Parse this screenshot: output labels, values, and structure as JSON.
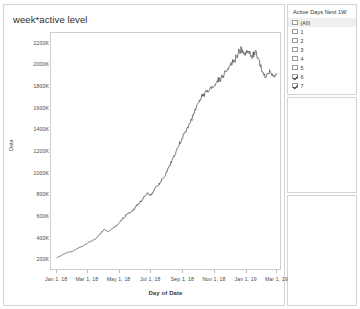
{
  "worksheet": {
    "title": "week*active level"
  },
  "chart_data": {
    "type": "line",
    "title": "week*active level",
    "xlabel": "Day of Date",
    "ylabel": "Data",
    "ylim": [
      100000,
      2300000
    ],
    "ytick_labels": [
      "2200K",
      "2000K",
      "1800K",
      "1600K",
      "1400K",
      "1200K",
      "1000K",
      "800K",
      "600K",
      "400K",
      "200K"
    ],
    "ytick_values": [
      2200000,
      2000000,
      1800000,
      1600000,
      1400000,
      1200000,
      1000000,
      800000,
      600000,
      400000,
      200000
    ],
    "xtick_labels": [
      "Jan 1, 18",
      "Mar 1, 18",
      "May 1, 18",
      "Jul 1, 18",
      "Sep 1, 18",
      "Nov 1, 18",
      "Jan 1, 19",
      "Mar 1, 19"
    ],
    "xlim": [
      "2017-12-20",
      "2019-03-10"
    ],
    "grid": false,
    "legend": "none",
    "line_color": "#5a5a5a",
    "series": [
      {
        "name": "week*active level",
        "x": [
          "2018-01-01",
          "2018-01-08",
          "2018-01-15",
          "2018-01-22",
          "2018-01-29",
          "2018-02-05",
          "2018-02-12",
          "2018-02-19",
          "2018-02-26",
          "2018-03-05",
          "2018-03-12",
          "2018-03-19",
          "2018-03-26",
          "2018-04-02",
          "2018-04-09",
          "2018-04-16",
          "2018-04-23",
          "2018-04-30",
          "2018-05-07",
          "2018-05-14",
          "2018-05-21",
          "2018-05-28",
          "2018-06-04",
          "2018-06-11",
          "2018-06-18",
          "2018-06-25",
          "2018-07-02",
          "2018-07-09",
          "2018-07-16",
          "2018-07-23",
          "2018-07-30",
          "2018-08-06",
          "2018-08-13",
          "2018-08-20",
          "2018-08-27",
          "2018-09-03",
          "2018-09-10",
          "2018-09-17",
          "2018-09-24",
          "2018-10-01",
          "2018-10-08",
          "2018-10-15",
          "2018-10-22",
          "2018-10-29",
          "2018-11-05",
          "2018-11-12",
          "2018-11-19",
          "2018-11-26",
          "2018-12-03",
          "2018-12-10",
          "2018-12-17",
          "2018-12-24",
          "2018-12-31",
          "2019-01-07",
          "2019-01-14",
          "2019-01-21",
          "2019-01-28",
          "2019-02-04",
          "2019-02-11",
          "2019-02-18",
          "2019-02-25",
          "2019-03-04"
        ],
        "values": [
          205000,
          225000,
          240000,
          258000,
          262000,
          280000,
          300000,
          312000,
          330000,
          352000,
          368000,
          392000,
          430000,
          470000,
          452000,
          470000,
          495000,
          520000,
          560000,
          600000,
          625000,
          640000,
          690000,
          720000,
          760000,
          800000,
          790000,
          840000,
          880000,
          930000,
          980000,
          1050000,
          1120000,
          1190000,
          1270000,
          1340000,
          1400000,
          1470000,
          1560000,
          1640000,
          1700000,
          1740000,
          1760000,
          1790000,
          1830000,
          1870000,
          1900000,
          1960000,
          2000000,
          2040000,
          2090000,
          2150000,
          2100000,
          2130000,
          2080000,
          2120000,
          2040000,
          1930000,
          1900000,
          1930000,
          1890000,
          1920000
        ]
      }
    ]
  },
  "filter_card": {
    "header": "Active Days Next 1W",
    "items": [
      {
        "label": "(All)",
        "checked": false,
        "is_all": true
      },
      {
        "label": "1",
        "checked": false,
        "is_all": false
      },
      {
        "label": "2",
        "checked": false,
        "is_all": false
      },
      {
        "label": "3",
        "checked": false,
        "is_all": false
      },
      {
        "label": "4",
        "checked": false,
        "is_all": false
      },
      {
        "label": "5",
        "checked": false,
        "is_all": false
      },
      {
        "label": "6",
        "checked": true,
        "is_all": false
      },
      {
        "label": "7",
        "checked": true,
        "is_all": false
      }
    ]
  }
}
